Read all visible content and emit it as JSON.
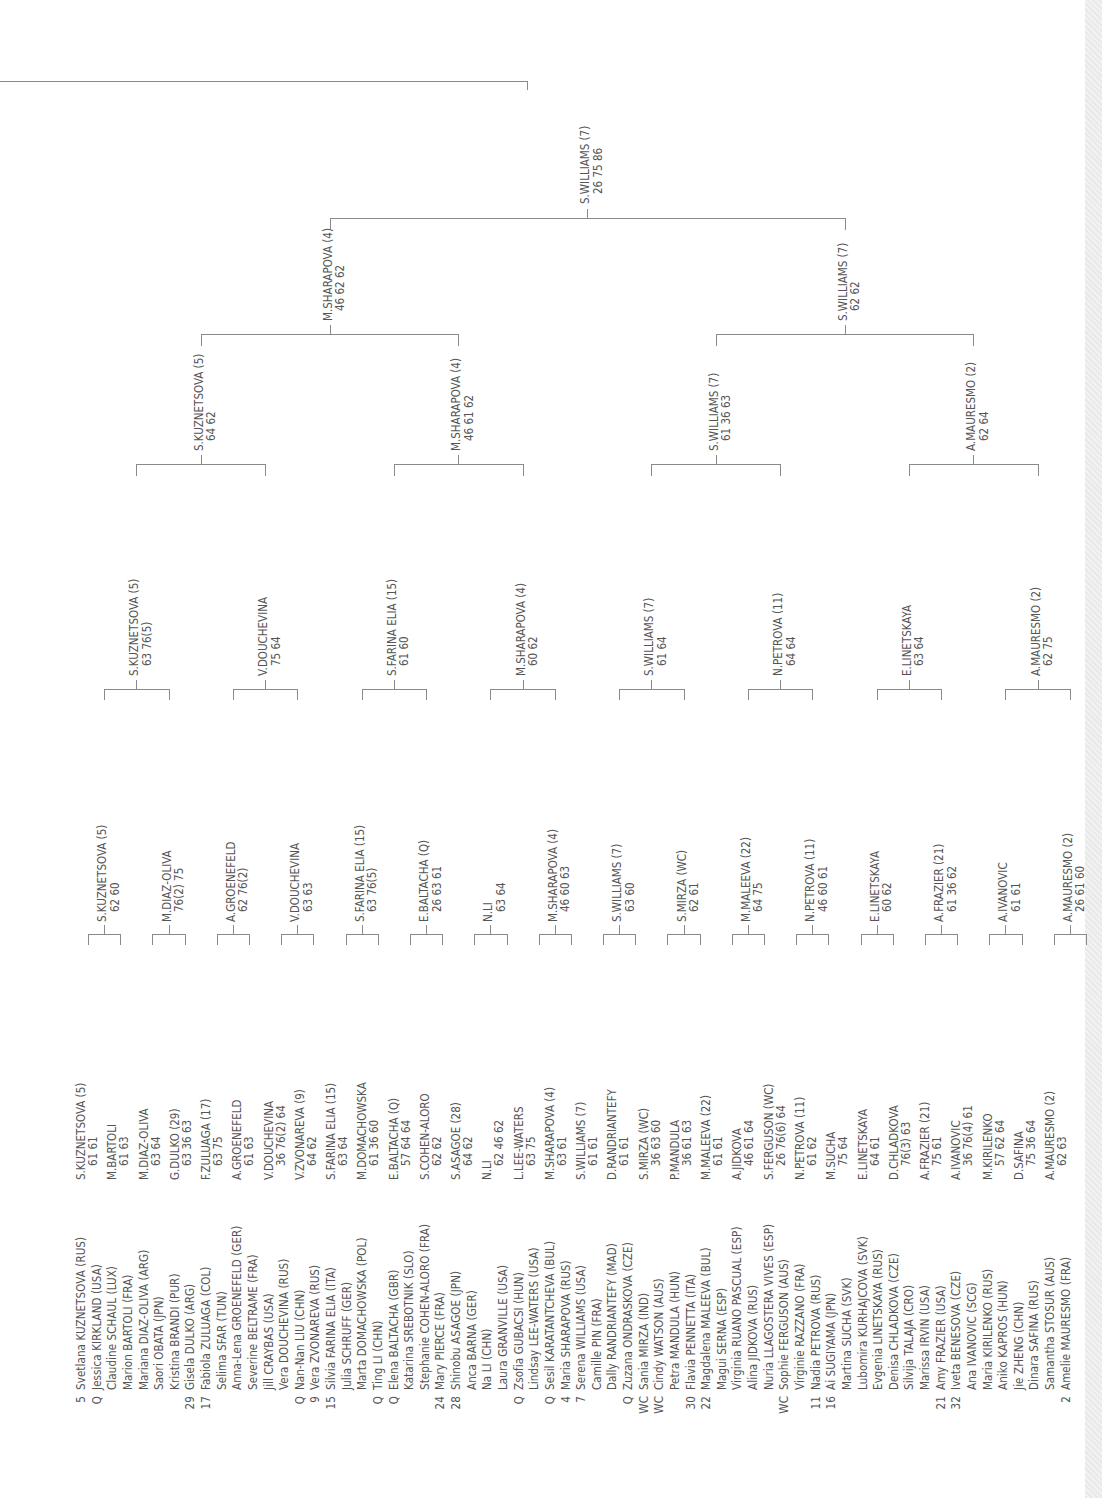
{
  "round1": [
    {
      "seed": "5",
      "name": "Svetlana KUZNETSOVA (RUS)"
    },
    {
      "seed": "Q",
      "name": "Jessica KIRKLAND (USA)"
    },
    {
      "seed": "",
      "name": "Claudine SCHAUL (LUX)"
    },
    {
      "seed": "",
      "name": "Marion BARTOLI (FRA)"
    },
    {
      "seed": "",
      "name": "Mariana DIAZ-OLIVA (ARG)"
    },
    {
      "seed": "",
      "name": "Saori OBATA (JPN)"
    },
    {
      "seed": "",
      "name": "Kristina BRANDI (PUR)"
    },
    {
      "seed": "29",
      "name": "Gisela DULKO (ARG)"
    },
    {
      "seed": "17",
      "name": "Fabiola ZULUAGA (COL)"
    },
    {
      "seed": "",
      "name": "Selima SFAR (TUN)"
    },
    {
      "seed": "",
      "name": "Anna-Lena GROENEFELD (GER)"
    },
    {
      "seed": "",
      "name": "Severine BELTRAME (FRA)"
    },
    {
      "seed": "",
      "name": "Jill CRAYBAS (USA)"
    },
    {
      "seed": "",
      "name": "Vera DOUCHEVINA (RUS)"
    },
    {
      "seed": "Q",
      "name": "Nan-Nan LIU (CHN)"
    },
    {
      "seed": "9",
      "name": "Vera ZVONAREVA (RUS)"
    },
    {
      "seed": "15",
      "name": "Silvia FARINA ELIA (ITA)"
    },
    {
      "seed": "",
      "name": "Julia SCHRUFF (GER)"
    },
    {
      "seed": "",
      "name": "Marta DOMACHOWSKA (POL)"
    },
    {
      "seed": "Q",
      "name": "Ting LI (CHN)"
    },
    {
      "seed": "Q",
      "name": "Elena BALTACHA (GBR)"
    },
    {
      "seed": "",
      "name": "Katarina SREBOTNIK (SLO)"
    },
    {
      "seed": "",
      "name": "Stephanie COHEN-ALORO (FRA)"
    },
    {
      "seed": "24",
      "name": "Mary PIERCE (FRA)"
    },
    {
      "seed": "28",
      "name": "Shinobu ASAGOE (JPN)"
    },
    {
      "seed": "",
      "name": "Anca BARNA (GER)"
    },
    {
      "seed": "",
      "name": "Na LI (CHN)"
    },
    {
      "seed": "",
      "name": "Laura GRANVILLE (USA)"
    },
    {
      "seed": "Q",
      "name": "Zsofia GUBACSI (HUN)"
    },
    {
      "seed": "",
      "name": "Lindsay LEE-WATERS (USA)"
    },
    {
      "seed": "Q",
      "name": "Sesil KARATANTCHEVA (BUL)"
    },
    {
      "seed": "4",
      "name": "Maria SHARAPOVA (RUS)"
    },
    {
      "seed": "7",
      "name": "Serena WILLIAMS (USA)"
    },
    {
      "seed": "",
      "name": "Camille PIN (FRA)"
    },
    {
      "seed": "",
      "name": "Dally RANDRIANTEFY (MAD)"
    },
    {
      "seed": "Q",
      "name": "Zuzana ONDRASKOVA (CZE)"
    },
    {
      "seed": "WC",
      "name": "Sania MIRZA (IND)"
    },
    {
      "seed": "WC",
      "name": "Cindy WATSON (AUS)"
    },
    {
      "seed": "",
      "name": "Petra MANDULA (HUN)"
    },
    {
      "seed": "30",
      "name": "Flavia PENNETTA (ITA)"
    },
    {
      "seed": "22",
      "name": "Magdalena MALEEVA (BUL)"
    },
    {
      "seed": "",
      "name": "Magui SERNA (ESP)"
    },
    {
      "seed": "",
      "name": "Virginia RUANO PASCUAL (ESP)"
    },
    {
      "seed": "",
      "name": "Alina JIDKOVA (RUS)"
    },
    {
      "seed": "",
      "name": "Nuria LLAGOSTERA VIVES (ESP)"
    },
    {
      "seed": "WC",
      "name": "Sophie FERGUSON (AUS)"
    },
    {
      "seed": "",
      "name": "Virginie RAZZANO (FRA)"
    },
    {
      "seed": "11",
      "name": "Nadia PETROVA (RUS)"
    },
    {
      "seed": "16",
      "name": "Ai SUGIYAMA (JPN)"
    },
    {
      "seed": "",
      "name": "Martina SUCHA (SVK)"
    },
    {
      "seed": "",
      "name": "Lubomira KURHAJCOVA (SVK)"
    },
    {
      "seed": "",
      "name": "Evgenia LINETSKAYA (RUS)"
    },
    {
      "seed": "",
      "name": "Denisa CHLADKOVA (CZE)"
    },
    {
      "seed": "",
      "name": "Silvija TALAJA (CRO)"
    },
    {
      "seed": "",
      "name": "Marissa IRVIN (USA)"
    },
    {
      "seed": "21",
      "name": "Amy FRAZIER (USA)"
    },
    {
      "seed": "32",
      "name": "Iveta BENESOVA (CZE)"
    },
    {
      "seed": "",
      "name": "Ana IVANOVIC (SCG)"
    },
    {
      "seed": "",
      "name": "Maria KIRILENKO (RUS)"
    },
    {
      "seed": "",
      "name": "Aniko KAPROS (HUN)"
    },
    {
      "seed": "",
      "name": "Jie ZHENG (CHN)"
    },
    {
      "seed": "",
      "name": "Dinara SAFINA (RUS)"
    },
    {
      "seed": "",
      "name": "Samantha STOSUR (AUS)"
    },
    {
      "seed": "2",
      "name": "Amelie MAURESMO (FRA)"
    }
  ],
  "round2": [
    {
      "name": "S.KUZNETSOVA (5)",
      "score": "61  61"
    },
    {
      "name": "M.BARTOLI",
      "score": "61  63"
    },
    {
      "name": "M.DIAZ-OLIVA",
      "score": "63  64"
    },
    {
      "name": "G.DULKO (29)",
      "score": "63  36  63"
    },
    {
      "name": "F.ZULUAGA (17)",
      "score": "63  75"
    },
    {
      "name": "A.GROENEFELD",
      "score": "61  63"
    },
    {
      "name": "V.DOUCHEVINA",
      "score": "36  76(2)  64"
    },
    {
      "name": "V.ZVONAREVA (9)",
      "score": "64  62"
    },
    {
      "name": "S.FARINA ELIA (15)",
      "score": "63  64"
    },
    {
      "name": "M.DOMACHOWSKA",
      "score": "61  36  60"
    },
    {
      "name": "E.BALTACHA (Q)",
      "score": "57  64  64"
    },
    {
      "name": "S.COHEN-ALORO",
      "score": "62  62"
    },
    {
      "name": "S.ASAGOE (28)",
      "score": "64  62"
    },
    {
      "name": "N.LI",
      "score": "62  46  62"
    },
    {
      "name": "L.LEE-WATERS",
      "score": "63  75"
    },
    {
      "name": "M.SHARAPOVA (4)",
      "score": "63  61"
    },
    {
      "name": "S.WILLIAMS (7)",
      "score": "61  61"
    },
    {
      "name": "D.RANDRIANTEFY",
      "score": "61  61"
    },
    {
      "name": "S.MIRZA (WC)",
      "score": "36  63  60"
    },
    {
      "name": "P.MANDULA",
      "score": "36  61  63"
    },
    {
      "name": "M.MALEEVA (22)",
      "score": "61  61"
    },
    {
      "name": "A.JIDKOVA",
      "score": "46  61  64"
    },
    {
      "name": "S.FERGUSON (WC)",
      "score": "26  76(6)  64"
    },
    {
      "name": "N.PETROVA (11)",
      "score": "61  62"
    },
    {
      "name": "M.SUCHA",
      "score": "75  64"
    },
    {
      "name": "E.LINETSKAYA",
      "score": "64  61"
    },
    {
      "name": "D.CHLADKOVA",
      "score": "76(3)  63"
    },
    {
      "name": "A.FRAZIER (21)",
      "score": "75  61"
    },
    {
      "name": "A.IVANOVIC",
      "score": "36  76(4)  61"
    },
    {
      "name": "M.KIRILENKO",
      "score": "57  62  64"
    },
    {
      "name": "D.SAFINA",
      "score": "75  36  64"
    },
    {
      "name": "A.MAURESMO (2)",
      "score": "62  63"
    }
  ],
  "round3": [
    {
      "name": "S.KUZNETSOVA (5)",
      "score": "62  60"
    },
    {
      "name": "M.DIAZ-OLIVA",
      "score": "76(2)  75"
    },
    {
      "name": "A.GROENEFELD",
      "score": "62  76(2)"
    },
    {
      "name": "V.DOUCHEVINA",
      "score": "63  63"
    },
    {
      "name": "S.FARINA ELIA (15)",
      "score": "63  76(5)"
    },
    {
      "name": "E.BALTACHA (Q)",
      "score": "26  63  61"
    },
    {
      "name": "N.LI",
      "score": "63  64"
    },
    {
      "name": "M.SHARAPOVA (4)",
      "score": "46  60  63"
    },
    {
      "name": "S.WILLIAMS (7)",
      "score": "63  60"
    },
    {
      "name": "S.MIRZA (WC)",
      "score": "62  61"
    },
    {
      "name": "M.MALEEVA (22)",
      "score": "64  75"
    },
    {
      "name": "N.PETROVA (11)",
      "score": "46  60  61"
    },
    {
      "name": "E.LINETSKAYA",
      "score": "60  62"
    },
    {
      "name": "A.FRAZIER (21)",
      "score": "61  36  62"
    },
    {
      "name": "A.IVANOVIC",
      "score": "61  61"
    },
    {
      "name": "A.MAURESMO (2)",
      "score": "26  61  60"
    }
  ],
  "round4": [
    {
      "name": "S.KUZNETSOVA (5)",
      "score": "63  76(5)"
    },
    {
      "name": "V.DOUCHEVINA",
      "score": "75  64"
    },
    {
      "name": "S.FARINA ELIA (15)",
      "score": "61  60"
    },
    {
      "name": "M.SHARAPOVA (4)",
      "score": "60  62"
    },
    {
      "name": "S.WILLIAMS (7)",
      "score": "61  64"
    },
    {
      "name": "N.PETROVA (11)",
      "score": "64  64"
    },
    {
      "name": "E.LINETSKAYA",
      "score": "63  64"
    },
    {
      "name": "A.MAURESMO (2)",
      "score": "62  75"
    }
  ],
  "quarterfinals": [
    {
      "name": "S.KUZNETSOVA (5)",
      "score": "64  62"
    },
    {
      "name": "M.SHARAPOVA (4)",
      "score": "46  61  62"
    },
    {
      "name": "S.WILLIAMS (7)",
      "score": "61  36  63"
    },
    {
      "name": "A.MAURESMO (2)",
      "score": "62  64"
    }
  ],
  "semifinals": [
    {
      "name": "M.SHARAPOVA (4)",
      "score": "46  62  62"
    },
    {
      "name": "S.WILLIAMS (7)",
      "score": "62  62"
    }
  ],
  "final": [
    {
      "name": "S.WILLIAMS (7)",
      "score": "26  75  86"
    }
  ]
}
